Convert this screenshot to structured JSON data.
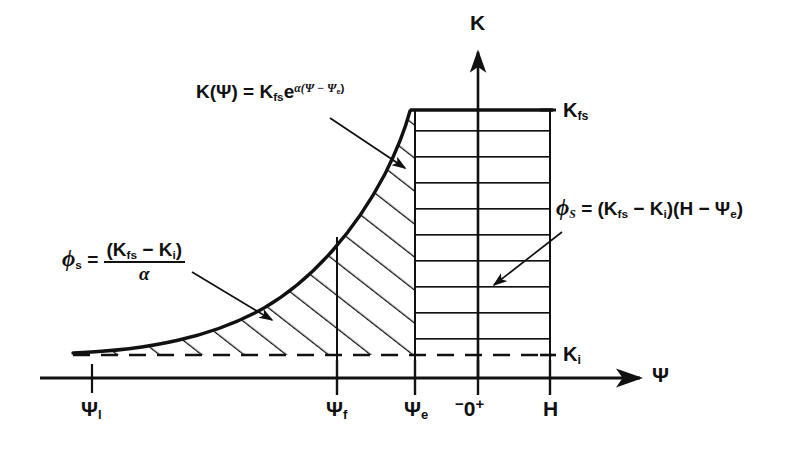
{
  "figure": {
    "type": "diagram",
    "axes": {
      "x_axis_label": "Ψ",
      "y_axis_label": "K",
      "x_ticks": [
        "Ψ",
        "Ψ",
        "Ψ",
        "0",
        "H"
      ],
      "x_tick_labels": [
        {
          "base": "Ψ",
          "sub": "l",
          "x": 92
        },
        {
          "base": "Ψ",
          "sub": "f",
          "x": 337
        },
        {
          "base": "Ψ",
          "sub": "e",
          "x": 415
        },
        {
          "base": "0",
          "sub": "",
          "x": 478
        },
        {
          "base": "H",
          "sub": "",
          "x": 550
        }
      ],
      "origin_minus": "−",
      "origin_plus": "+",
      "origin_zero": "0"
    },
    "levels": [
      {
        "name": "K",
        "sub": "fs",
        "label": "K_fs",
        "y": 110
      },
      {
        "name": "K",
        "sub": "i",
        "label": "K_i",
        "y": 355
      }
    ],
    "annotations": {
      "curve_equation": {
        "lhs_k": "K",
        "lhs_arg": "(Ψ)",
        "equals": "=",
        "rhs_k": "K",
        "rhs_sub": "fs",
        "rhs_e": "e",
        "exponent": "α(Ψ − Ψ",
        "exponent_sub": "e",
        "exponent_close": ")"
      },
      "phi_s_fraction": {
        "phi": "ϕ",
        "phi_sub": "s",
        "equals": "=",
        "numerator_open": "(K",
        "numerator_sub1": "fs",
        "numerator_minus": "− K",
        "numerator_sub2": "i",
        "numerator_close": ")",
        "denominator": "α"
      },
      "phi_S_rect": {
        "phi": "ϕ",
        "phi_sub": "S",
        "equals": "=",
        "expr_open": "(K",
        "expr_sub1": "fs",
        "expr_minus": "− K",
        "expr_sub2": "i",
        "expr_mid": ")(H − Ψ",
        "expr_sub3": "e",
        "expr_close": ")"
      }
    },
    "colors": {
      "ink": "#111111",
      "background": "#ffffff"
    }
  }
}
